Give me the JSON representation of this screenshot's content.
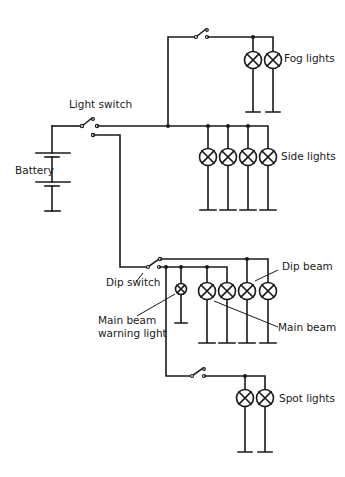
{
  "diagram": {
    "type": "vehicle lighting circuit",
    "colors": {
      "line": "#1a1a1a",
      "background": "#ffffff"
    },
    "labels": {
      "light_switch": "Light switch",
      "battery": "Battery",
      "fog_lights": "Fog lights",
      "side_lights": "Side lights",
      "dip_switch": "Dip switch",
      "dip_beam": "Dip beam",
      "main_beam": "Main beam",
      "main_beam_warning_1": "Main beam",
      "main_beam_warning_2": "warning light",
      "spot_lights": "Spot lights"
    },
    "components": [
      {
        "id": "battery",
        "kind": "battery",
        "cells": 2
      },
      {
        "id": "light-switch",
        "kind": "two-way switch"
      },
      {
        "id": "fog-switch",
        "kind": "switch"
      },
      {
        "id": "fog-lamps",
        "kind": "lamp",
        "count": 2
      },
      {
        "id": "side-lamps",
        "kind": "lamp",
        "count": 4
      },
      {
        "id": "dip-switch",
        "kind": "two-way switch"
      },
      {
        "id": "main-beam-warning-lamp",
        "kind": "lamp",
        "count": 1
      },
      {
        "id": "main-beam-lamps",
        "kind": "lamp",
        "count": 2
      },
      {
        "id": "dip-beam-lamps",
        "kind": "lamp",
        "count": 2
      },
      {
        "id": "spot-switch",
        "kind": "switch"
      },
      {
        "id": "spot-lamps",
        "kind": "lamp",
        "count": 2
      }
    ]
  }
}
